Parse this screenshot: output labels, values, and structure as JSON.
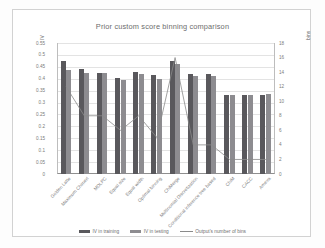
{
  "chart_data": {
    "type": "bar",
    "title": "Prior custom score binning comparison",
    "xlabel": "",
    "ylabel": "IV",
    "y2label": "bins",
    "ylim": [
      0,
      0.55
    ],
    "y2lim": [
      0,
      18
    ],
    "grid": true,
    "legend_position": "bottom",
    "yticks": [
      "0",
      "0.05",
      "0.1",
      "0.15",
      "0.2",
      "0.25",
      "0.3",
      "0.35",
      "0.4",
      "0.45",
      "0.5",
      "0.55"
    ],
    "y2ticks": [
      "0",
      "2",
      "4",
      "6",
      "8",
      "10",
      "12",
      "14",
      "16",
      "18"
    ],
    "categories": [
      "Golden Latte",
      "Maximum Chimerl",
      "MDLPC",
      "Equal size",
      "Equal width",
      "Optimal binning",
      "ChiMerge",
      "Multinomial Discretization",
      "Conditional inference tree based",
      "ChiM",
      "CACC",
      "Ameva"
    ],
    "series": [
      {
        "name": "IV in training",
        "axis": "left",
        "color": "#59585c",
        "values": [
          0.475,
          0.44,
          0.425,
          0.405,
          0.43,
          0.415,
          0.475,
          0.42,
          0.42,
          0.33,
          0.33,
          0.33
        ]
      },
      {
        "name": "IV in testing",
        "axis": "left",
        "color": "#8d8c90",
        "values": [
          0.435,
          0.425,
          0.425,
          0.395,
          0.42,
          0.4,
          0.46,
          0.41,
          0.41,
          0.33,
          0.33,
          0.335
        ]
      },
      {
        "name": "Output's number of bins",
        "axis": "right",
        "color": "#8a8a8a",
        "values": [
          12,
          8,
          8,
          6,
          8,
          5,
          16,
          4,
          4,
          2,
          2,
          2
        ]
      }
    ]
  },
  "legend": {
    "items": [
      {
        "label": "IV in training"
      },
      {
        "label": "IV in testing"
      },
      {
        "label": "Output's number of bins"
      }
    ]
  }
}
